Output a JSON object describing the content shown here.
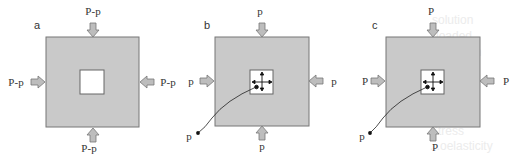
{
  "colors": {
    "block_fill": "#c9c9c9",
    "block_stroke": "#777777",
    "arrow_fill": "#bdbdbd",
    "arrow_stroke": "#777777",
    "hole_fill": "#ffffff",
    "line": "#222222",
    "text": "#333333"
  },
  "panels": [
    {
      "id": "a",
      "label": "a",
      "top_load": "P-p",
      "left_load": "P-p",
      "right_load": "P-p",
      "bottom_load": "P-p",
      "has_pressure_arrows": false,
      "lead_label": ""
    },
    {
      "id": "b",
      "label": "b",
      "top_load": "p",
      "left_load": "p",
      "right_load": "p",
      "bottom_load": "p",
      "has_pressure_arrows": true,
      "lead_label": "p"
    },
    {
      "id": "c",
      "label": "c",
      "top_load": "P",
      "left_load": "P",
      "right_load": "P",
      "bottom_load": "P",
      "has_pressure_arrows": true,
      "lead_label": "p"
    }
  ],
  "ghost_text": [
    "Stress",
    "...oelasticity"
  ]
}
